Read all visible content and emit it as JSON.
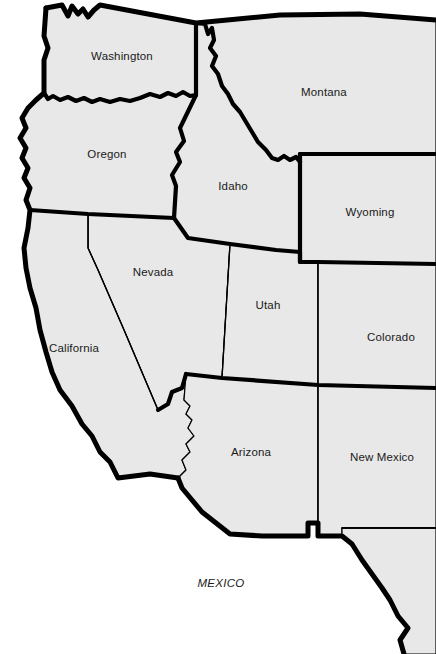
{
  "map": {
    "title": "Western United States",
    "background_color": "#ffffff",
    "state_fill_color": "#e8e8e8",
    "border_color": "#000000",
    "label_color": "#1a1a1a",
    "states": [
      {
        "name": "Washington",
        "label": "Washington",
        "x": 122,
        "y": 56,
        "style": "normal"
      },
      {
        "name": "Montana",
        "label": "Montana",
        "x": 324,
        "y": 92,
        "style": "normal"
      },
      {
        "name": "Oregon",
        "label": "Oregon",
        "x": 107,
        "y": 154,
        "style": "normal"
      },
      {
        "name": "Idaho",
        "label": "Idaho",
        "x": 233,
        "y": 186,
        "style": "normal"
      },
      {
        "name": "Wyoming",
        "label": "Wyoming",
        "x": 370,
        "y": 212,
        "style": "normal"
      },
      {
        "name": "Nevada",
        "label": "Nevada",
        "x": 153,
        "y": 272,
        "style": "normal"
      },
      {
        "name": "Utah",
        "label": "Utah",
        "x": 268,
        "y": 305,
        "style": "normal"
      },
      {
        "name": "Colorado",
        "label": "Colorado",
        "x": 391,
        "y": 337,
        "style": "normal"
      },
      {
        "name": "California",
        "label": "California",
        "x": 74,
        "y": 348,
        "style": "normal"
      },
      {
        "name": "Arizona",
        "label": "Arizona",
        "x": 251,
        "y": 452,
        "style": "normal"
      },
      {
        "name": "New Mexico",
        "label": "New Mexico",
        "x": 382,
        "y": 457,
        "style": "normal"
      }
    ],
    "countries": [
      {
        "name": "Mexico",
        "label": "MEXICO",
        "x": 221,
        "y": 583,
        "style": "italic"
      }
    ]
  }
}
